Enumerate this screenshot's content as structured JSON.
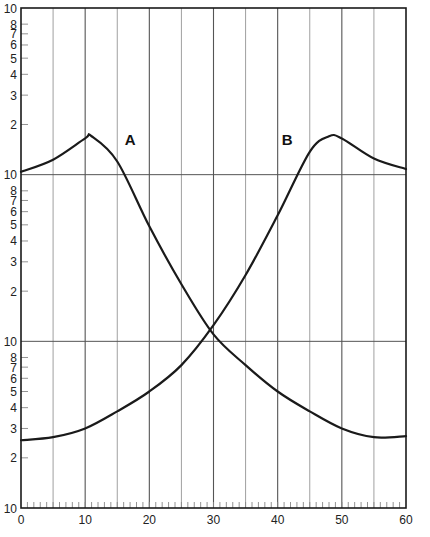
{
  "chart_data": {
    "type": "line",
    "title": "",
    "xlabel": "",
    "ylabel": "",
    "xlim": [
      0,
      60
    ],
    "x_ticks": [
      0,
      10,
      20,
      30,
      40,
      50,
      60
    ],
    "x_tick_labels": [
      "0",
      "10",
      "20",
      "30",
      "40",
      "50",
      "60"
    ],
    "x_minor_tick_step": 1,
    "x_gridline_step": 5,
    "y_scale": "log",
    "ylim": [
      1,
      1000
    ],
    "y_decades": 3,
    "y_tick_labels_per_decade": [
      "10",
      "2",
      "3",
      "4",
      "5",
      "6",
      "7",
      "8"
    ],
    "y_decade_label": "10",
    "grid": true,
    "series": [
      {
        "name": "A",
        "label_position": {
          "x": 17,
          "y": 150
        },
        "x": [
          0,
          5,
          10,
          11,
          15,
          20,
          25,
          30,
          35,
          40,
          45,
          50,
          55,
          60
        ],
        "values": [
          104,
          123,
          165,
          170,
          120,
          49,
          22,
          11,
          7.2,
          5.0,
          3.8,
          3.0,
          2.66,
          2.7
        ]
      },
      {
        "name": "B",
        "label_position": {
          "x": 41.5,
          "y": 150
        },
        "x": [
          0,
          5,
          10,
          15,
          20,
          25,
          30,
          35,
          40,
          45,
          48,
          50,
          55,
          60
        ],
        "values": [
          2.55,
          2.66,
          3.0,
          3.8,
          5.0,
          7.2,
          12.5,
          25,
          57,
          137,
          170,
          165,
          125,
          108
        ]
      }
    ],
    "annotations": [
      "A",
      "B"
    ],
    "legend": "none"
  },
  "colors": {
    "curve": "#1a1a1a",
    "frame": "#1a1a1a",
    "grid_major": "#555555",
    "grid_minor": "#888888",
    "background": "#ffffff"
  }
}
